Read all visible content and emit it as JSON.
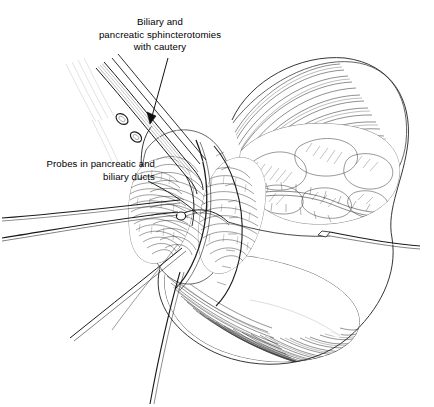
{
  "figure": {
    "kind": "medical-line-art-illustration",
    "background_color": "#ffffff",
    "ink_color": "#1a1a1a",
    "width": 434,
    "height": 407
  },
  "labels": [
    {
      "id": "cautery",
      "name": "label-biliary-pancreatic-sphincterotomies",
      "lines": [
        "Biliary and",
        "pancreatic sphincterotomies",
        "with cautery"
      ],
      "line1": "Biliary and",
      "line2": "pancreatic sphincterotomies",
      "line3": "with cautery",
      "align": "center",
      "leader": "arrow",
      "leader_from": [
        168,
        58
      ],
      "leader_to": [
        150,
        123
      ]
    },
    {
      "id": "probes",
      "name": "label-probes-in-pancreatic-and-biliary-ducts",
      "lines": [
        "Probes in pancreatic and",
        "biliary ducts"
      ],
      "line1": "Probes in pancreatic and",
      "line2": "biliary ducts",
      "align": "right",
      "leader": "curve",
      "leader_from": [
        148,
        181
      ],
      "leader_to": [
        196,
        213
      ]
    }
  ],
  "structures": [
    {
      "name": "duodenum",
      "note": "opened duodenal loop, hatched wall"
    },
    {
      "name": "pancreas-head",
      "note": "lobulated glandular mass upper right"
    },
    {
      "name": "ampulla-of-vater",
      "note": "incised papilla center"
    },
    {
      "name": "pancreatic-duct-probe",
      "note": "thin probe from left"
    },
    {
      "name": "biliary-duct-probe",
      "note": "second thin probe from left"
    },
    {
      "name": "cautery-instrument",
      "note": "ring-handled electrocautery, upper left"
    },
    {
      "name": "retractor",
      "note": "thin retractor exiting right"
    },
    {
      "name": "stay-sutures",
      "note": "traction sutures at duodenotomy edges"
    }
  ]
}
